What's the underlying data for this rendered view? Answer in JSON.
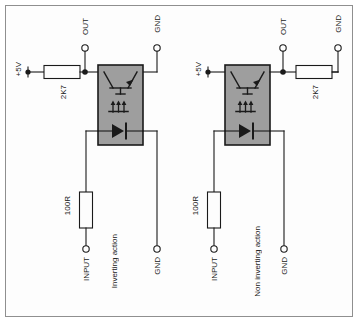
{
  "diagram": {
    "background_color": "#fdfdfd",
    "line_color": "#1a1a1a",
    "package_fill": "#9e9e9e",
    "border_color": "#8f8f8f"
  },
  "circuits": [
    {
      "id": "left",
      "caption": "Inverting action",
      "supply_label": "+5V",
      "pullup_resistor": "2K7",
      "input_resistor": "100R",
      "terminals": [
        {
          "name": "OUT",
          "label": "OUT"
        },
        {
          "name": "GND",
          "label": "GND"
        },
        {
          "name": "INPUT",
          "label": "INPUT"
        },
        {
          "name": "GND_IN",
          "label": "GND"
        }
      ],
      "package": {
        "name": "optocoupler",
        "phototransistor": "phototransistor-symbol",
        "light_arrows": "light-emission-arrows",
        "led": "led-diode-symbol"
      }
    },
    {
      "id": "right",
      "caption": "Non inverting action",
      "supply_label": "+5V",
      "pullup_resistor": "2K7",
      "input_resistor": "100R",
      "terminals": [
        {
          "name": "OUT",
          "label": "OUT"
        },
        {
          "name": "GND",
          "label": "GND"
        },
        {
          "name": "INPUT",
          "label": "INPUT"
        },
        {
          "name": "GND_IN",
          "label": "GND"
        }
      ],
      "package": {
        "name": "optocoupler",
        "phototransistor": "phototransistor-symbol",
        "light_arrows": "light-emission-arrows",
        "led": "led-diode-symbol"
      }
    }
  ]
}
